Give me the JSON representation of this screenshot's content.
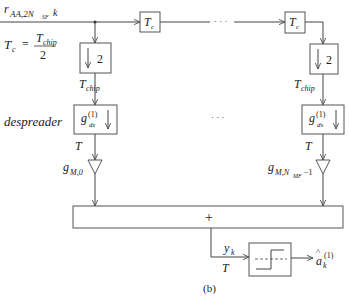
{
  "diagram": {
    "caption": "(b)",
    "input_signal": {
      "base": "r",
      "subscript": "AA,2N",
      "sub2": "SF",
      "index": "k"
    },
    "tc_definition": {
      "lhs": "T",
      "lhs_sub": "c",
      "equals": "=",
      "numerator": "T",
      "numerator_sub": "chip",
      "denominator": "2"
    },
    "delay_blocks": [
      {
        "label": "T",
        "sub": "c"
      },
      {
        "label": "T",
        "sub": "c"
      }
    ],
    "ellipsis": "· · ·",
    "downsample_blocks": [
      {
        "label": "2",
        "arrow": "↓"
      },
      {
        "label": "2",
        "arrow": "↓"
      }
    ],
    "rate_labels": {
      "chip": {
        "base": "T",
        "sub": "chip"
      },
      "symbol": "T"
    },
    "despreader_label": "despreader",
    "despreader_blocks": [
      {
        "base": "g",
        "sup": "(1)",
        "sub": "ds",
        "arrow": "↓"
      },
      {
        "base": "g",
        "sup": "(1)",
        "sub": "ds",
        "arrow": "↓"
      }
    ],
    "gains": [
      {
        "base": "g",
        "sub": "M,0"
      },
      {
        "base": "g",
        "sub": "M,N",
        "sub2": "MF",
        "suffix": "−1"
      }
    ],
    "summer": {
      "symbol": "+"
    },
    "output": {
      "base": "y",
      "sub": "k",
      "rate": "T"
    },
    "decision": {
      "base": "a",
      "hat": "^",
      "sub": "k",
      "sup": "(1)"
    }
  }
}
